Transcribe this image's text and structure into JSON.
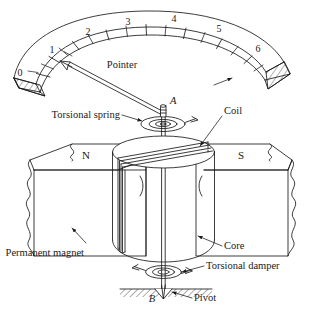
{
  "figure": {
    "ink_color": "#1a1a1a",
    "paper_color": "#ffffff"
  },
  "scale": {
    "label": "Scale",
    "tick_numbers": [
      "0",
      "1",
      "2",
      "3",
      "4",
      "5",
      "6"
    ],
    "minor_ticks_between": 1
  },
  "labels": {
    "pointer": "Pointer",
    "torsional_spring": "Torsional spring",
    "coil": "Coil",
    "core": "Core",
    "permanent_magnet": "Permanent magnet",
    "torsional_damper": "Torsional damper",
    "pivot": "Pivot",
    "point_a": "A",
    "point_b": "B",
    "pole_north": "N",
    "pole_south": "S"
  }
}
